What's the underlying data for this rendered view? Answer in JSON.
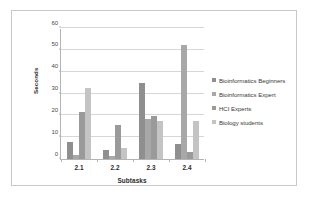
{
  "chart_data": {
    "type": "bar",
    "title": "",
    "xlabel": "Subtasks",
    "ylabel": "Seconds",
    "categories": [
      "2.1",
      "2.2",
      "2.3",
      "2.4"
    ],
    "ylim": [
      0,
      60
    ],
    "yticks": [
      0,
      10,
      20,
      30,
      40,
      50,
      60
    ],
    "grid": true,
    "legend_position": "right",
    "series": [
      {
        "name": "Bioinformatics Beginners",
        "color": "#8f8f8f",
        "values": [
          8,
          4,
          35,
          7
        ]
      },
      {
        "name": "Bioinformatics Expert",
        "color": "#a8a8a8",
        "values": [
          2,
          1.5,
          18.5,
          52
        ]
      },
      {
        "name": "HCI Experts",
        "color": "#9a9a9a",
        "values": [
          21.5,
          15.5,
          19.5,
          3
        ]
      },
      {
        "name": "Biology students",
        "color": "#c4c4c4",
        "values": [
          32.5,
          5,
          17.5,
          17.5
        ]
      }
    ]
  },
  "axes": {
    "y_title": "Seconds",
    "x_title": "Subtasks",
    "y_tick_labels": [
      "0",
      "10",
      "20",
      "30",
      "40",
      "50",
      "60"
    ],
    "x_tick_labels": [
      "2.1",
      "2.2",
      "2.3",
      "2.4"
    ]
  },
  "legend": {
    "items": [
      {
        "label": "Bioinformatics Beginners",
        "color": "#8f8f8f"
      },
      {
        "label": "Bioinformatics Expert",
        "color": "#a8a8a8"
      },
      {
        "label": "HCI Experts",
        "color": "#9a9a9a"
      },
      {
        "label": "Biology students",
        "color": "#c4c4c4"
      }
    ]
  },
  "style": {
    "frame_border": "#c9c9c9",
    "axis_line": "#b4b4b4",
    "gridline": "#d6d6d6",
    "background": "#ffffff"
  }
}
